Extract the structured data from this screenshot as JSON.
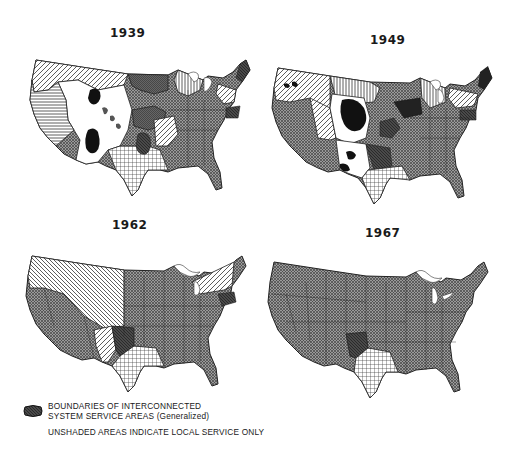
{
  "figure": {
    "maps": [
      {
        "year": "1939",
        "label_pos": [
          110,
          26
        ]
      },
      {
        "year": "1949",
        "label_pos": [
          370,
          33
        ]
      },
      {
        "year": "1962",
        "label_pos": [
          112,
          218
        ]
      },
      {
        "year": "1967",
        "label_pos": [
          365,
          226
        ]
      }
    ],
    "legend": {
      "swatch_label_line1": "BOUNDARIES OF INTERCONNECTED",
      "swatch_label_line2": "SYSTEM SERVICE AREAS (Generalized)",
      "note": "UNSHADED AREAS INDICATE LOCAL SERVICE ONLY"
    },
    "colors": {
      "crosshatch_gray": "#7a7a7a",
      "dark_region": "#3a3a3a",
      "black_blob": "#111111",
      "border": "#222222",
      "background": "#ffffff"
    }
  }
}
